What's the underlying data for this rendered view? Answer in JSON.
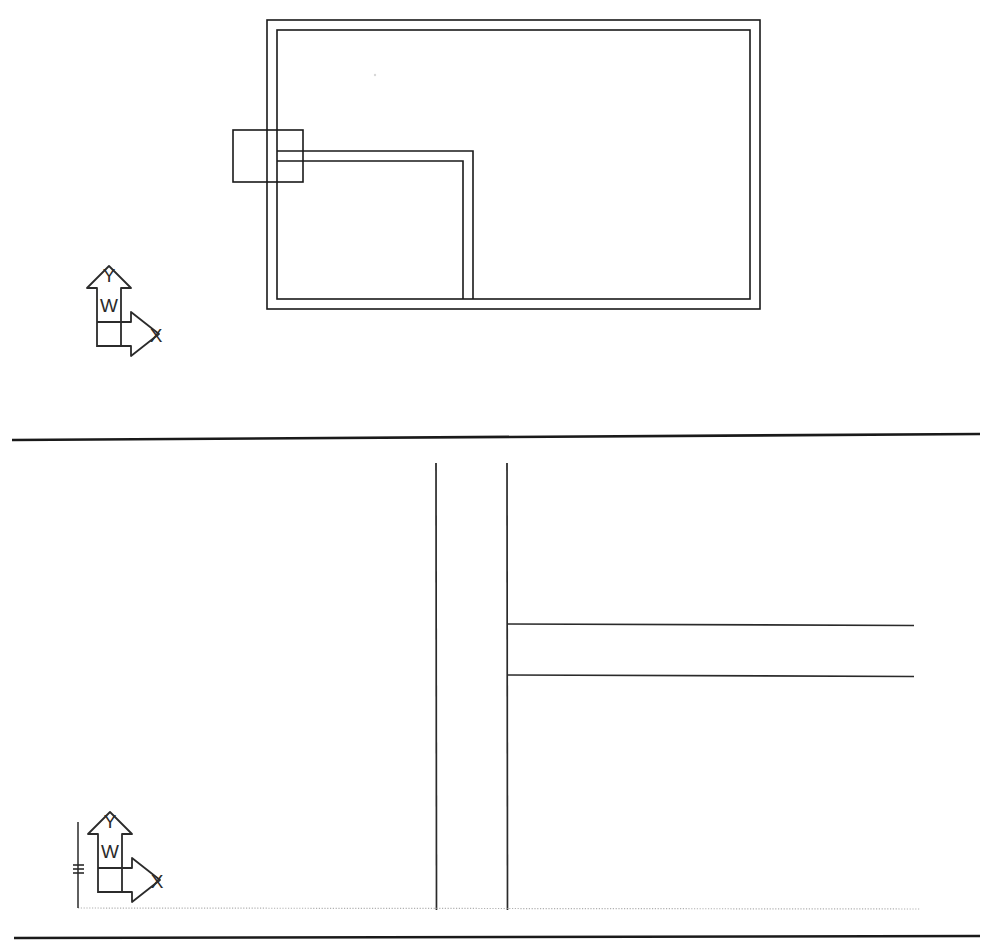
{
  "document": {
    "kind": "scanned-cad-drawing",
    "background_color": "#ffffff",
    "ink_color": "#1a1a1a",
    "faint_ink_color": "#9a9a9a",
    "width": 988,
    "height": 945
  },
  "views": [
    {
      "id": "view-top",
      "name": "floor-plan-view",
      "ucs_icon": {
        "name": "ucs-icon",
        "labels": {
          "y_axis": "Y",
          "x_axis": "X",
          "world": "W"
        },
        "origin_x": 97,
        "origin_y": 322
      },
      "geometry": {
        "outer_wall": {
          "name": "outer-wall-rectangle",
          "outer": {
            "x": 267,
            "y": 20,
            "width": 493,
            "height": 289
          },
          "inner": {
            "x": 277,
            "y": 30,
            "width": 473,
            "height": 269
          },
          "thickness": 10
        },
        "partition_wall": {
          "name": "interior-partition-wall",
          "description": "L-shaped double-line partition running right from the left wall then down to the bottom wall",
          "horizontal_y_outer": 151,
          "horizontal_y_inner": 161,
          "corner_x_outer": 473,
          "corner_x_inner": 463,
          "start_x": 277,
          "end_y": 299
        },
        "opening_block": {
          "name": "door-opening-block",
          "x": 233,
          "y": 130,
          "width": 70,
          "height": 52
        }
      }
    },
    {
      "id": "view-bottom",
      "name": "detail-section-view",
      "ucs_icon": {
        "name": "ucs-icon",
        "labels": {
          "y_axis": "Y",
          "x_axis": "X",
          "world": "W"
        },
        "origin_x": 98,
        "origin_y": 868
      },
      "geometry": {
        "vertical_lines": [
          {
            "name": "wall-line-left",
            "x": 436,
            "y1": 463,
            "y2": 910
          },
          {
            "name": "wall-line-right",
            "x": 507,
            "y1": 463,
            "y2": 910
          }
        ],
        "horizontal_lines": [
          {
            "name": "branch-line-upper",
            "x1": 507,
            "x2": 914,
            "y": 624
          },
          {
            "name": "branch-line-lower",
            "x1": 507,
            "x2": 914,
            "y": 675
          }
        ],
        "baseline": {
          "name": "construction-baseline",
          "x1": 78,
          "x2": 920,
          "y": 908,
          "style": "dotted"
        },
        "extension_line": {
          "name": "vertical-extension-line",
          "x": 78,
          "y1": 822,
          "y2": 908
        },
        "origin_marker": {
          "name": "origin-tick-marker",
          "x": 78,
          "y": 868
        }
      }
    }
  ],
  "separators": [
    {
      "name": "divider-rule-top",
      "x1": 12,
      "x2": 980,
      "y1": 440,
      "y2": 434
    },
    {
      "name": "divider-rule-bottom",
      "x1": 14,
      "x2": 980,
      "y1": 938,
      "y2": 936
    }
  ],
  "artifacts": [
    {
      "name": "scan-speck",
      "x": 375,
      "y": 75,
      "size": 2
    }
  ]
}
